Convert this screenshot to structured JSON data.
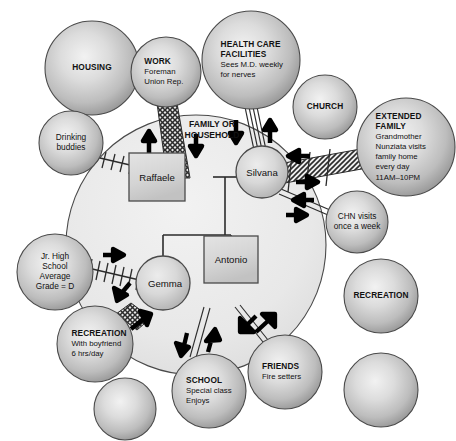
{
  "diagram": {
    "type": "ecomap",
    "household": {
      "label_line1": "FAMILY OR",
      "label_line2": "HOUSEHOLD",
      "cx": 196,
      "cy": 245,
      "r": 130
    },
    "members": [
      {
        "id": "raffaele",
        "name": "Raffaele",
        "shape": "square",
        "x": 157,
        "y": 177,
        "w": 56,
        "h": 48
      },
      {
        "id": "silvana",
        "name": "Silvana",
        "shape": "circle",
        "x": 262,
        "y": 172,
        "r": 26
      },
      {
        "id": "gemma",
        "name": "Gemma",
        "shape": "circle",
        "x": 163,
        "y": 283,
        "r": 27
      },
      {
        "id": "antonio",
        "name": "Antonio",
        "shape": "square",
        "x": 231,
        "y": 259,
        "w": 54,
        "h": 48
      }
    ],
    "systems": [
      {
        "id": "housing",
        "cx": 92,
        "cy": 68,
        "r": 47,
        "lines": [
          {
            "text": "HOUSING",
            "style": "title"
          }
        ],
        "connected_to": null
      },
      {
        "id": "work",
        "cx": 166,
        "cy": 72,
        "r": 35,
        "lines": [
          {
            "text": "WORK",
            "style": "title"
          },
          {
            "text": "Foreman",
            "style": "sub"
          },
          {
            "text": "Union Rep.",
            "style": "sub"
          }
        ],
        "connected_to": "raffaele"
      },
      {
        "id": "health-care-facilities",
        "cx": 251,
        "cy": 60,
        "r": 49,
        "lines": [
          {
            "text": "HEALTH CARE",
            "style": "title"
          },
          {
            "text": "FACILITIES",
            "style": "title"
          },
          {
            "text": "Sees M.D. weekly",
            "style": "sub"
          },
          {
            "text": "for nerves",
            "style": "sub"
          }
        ],
        "connected_to": "silvana"
      },
      {
        "id": "church",
        "cx": 325,
        "cy": 107,
        "r": 32,
        "lines": [
          {
            "text": "CHURCH",
            "style": "title"
          }
        ],
        "connected_to": null
      },
      {
        "id": "extended-family",
        "cx": 406,
        "cy": 147,
        "r": 49,
        "lines": [
          {
            "text": "EXTENDED",
            "style": "title"
          },
          {
            "text": "FAMILY",
            "style": "title"
          },
          {
            "text": "Grandmother",
            "style": "sub"
          },
          {
            "text": "Nunziata visits",
            "style": "sub"
          },
          {
            "text": "family home",
            "style": "sub"
          },
          {
            "text": "every day",
            "style": "sub"
          },
          {
            "text": "11AM–10PM",
            "style": "sub"
          }
        ],
        "connected_to": "silvana"
      },
      {
        "id": "drinking-buddies",
        "cx": 71,
        "cy": 143,
        "r": 32,
        "lines": [
          {
            "text": "Drinking",
            "style": "plain"
          },
          {
            "text": "buddies",
            "style": "plain"
          }
        ],
        "connected_to": "raffaele"
      },
      {
        "id": "chn-visits",
        "cx": 357,
        "cy": 222,
        "r": 31,
        "lines": [
          {
            "text": "CHN visits",
            "style": "plain"
          },
          {
            "text": "once a week",
            "style": "plain"
          }
        ],
        "connected_to": "silvana"
      },
      {
        "id": "jr-high-school",
        "cx": 55,
        "cy": 272,
        "r": 38,
        "lines": [
          {
            "text": "Jr. High",
            "style": "plain"
          },
          {
            "text": "School",
            "style": "plain"
          },
          {
            "text": "Average",
            "style": "plain"
          },
          {
            "text": "Grade = D",
            "style": "plain"
          }
        ],
        "connected_to": "gemma"
      },
      {
        "id": "recreation-boyfriend",
        "cx": 95,
        "cy": 344,
        "r": 38,
        "lines": [
          {
            "text": "RECREATION",
            "style": "title"
          },
          {
            "text": "With boyfriend",
            "style": "sub"
          },
          {
            "text": "6 hrs/day",
            "style": "sub"
          }
        ],
        "connected_to": "gemma"
      },
      {
        "id": "recreation-right",
        "cx": 381,
        "cy": 296,
        "r": 37,
        "lines": [
          {
            "text": "RECREATION",
            "style": "title"
          }
        ],
        "connected_to": null
      },
      {
        "id": "school",
        "cx": 209,
        "cy": 391,
        "r": 37,
        "lines": [
          {
            "text": "SCHOOL",
            "style": "title"
          },
          {
            "text": "Special class",
            "style": "sub"
          },
          {
            "text": "Enjoys",
            "style": "sub"
          }
        ],
        "connected_to": "antonio"
      },
      {
        "id": "friends",
        "cx": 285,
        "cy": 372,
        "r": 37,
        "lines": [
          {
            "text": "FRIENDS",
            "style": "title"
          },
          {
            "text": "Fire setters",
            "style": "sub"
          }
        ],
        "connected_to": "antonio"
      },
      {
        "id": "blank-bottom-left",
        "cx": 125,
        "cy": 409,
        "r": 31,
        "lines": [],
        "connected_to": null
      },
      {
        "id": "blank-bottom-right",
        "cx": 381,
        "cy": 390,
        "r": 37,
        "lines": [],
        "connected_to": null
      }
    ],
    "colors": {
      "sphere_edge": "#8d8d8d",
      "sphere_center": "#e8e8e8",
      "sphere_outline": "#4a4a4a",
      "household_fill": "#ececec",
      "member_fill": "#d6d6d6",
      "stroke": "#2b2b2b",
      "text": "#111111"
    }
  }
}
